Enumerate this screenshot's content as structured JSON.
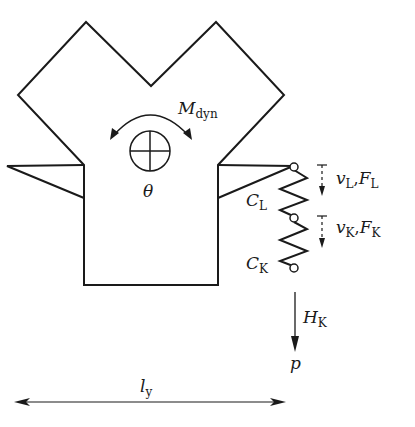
{
  "diagram": {
    "colors": {
      "stroke": "#1a1a1a",
      "background": "#ffffff"
    },
    "labels": {
      "moment": {
        "main": "M",
        "sub": "dyn"
      },
      "rotation": {
        "main": "θ"
      },
      "spring_L": {
        "main": "C",
        "sub": "L"
      },
      "spring_K": {
        "main": "C",
        "sub": "K"
      },
      "disp_L": {
        "v": "v",
        "v_sub": "L",
        "sep": ",",
        "f": "F",
        "f_sub": "L"
      },
      "disp_K": {
        "v": "v",
        "v_sub": "K",
        "sep": ",",
        "f": "F",
        "f_sub": "K"
      },
      "force_H": {
        "main": "H",
        "sub": "K"
      },
      "load_p": {
        "main": "p"
      },
      "length": {
        "main": "l",
        "sub": "y"
      }
    },
    "nodes": [
      "spring-top-node",
      "spring-middle-node",
      "spring-bottom-node"
    ],
    "icons": [
      "center-of-mass-icon",
      "rotation-arrow-icon",
      "spring-icon",
      "arrow-down-icon",
      "double-arrow-icon"
    ]
  }
}
